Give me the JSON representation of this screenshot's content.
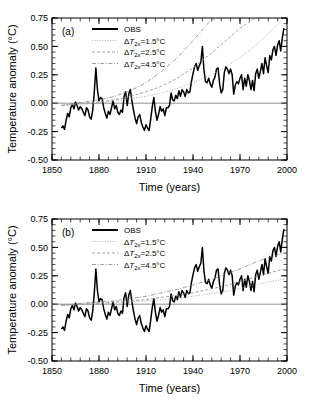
{
  "figure": {
    "panels": [
      {
        "label": "(a)",
        "axes": {
          "xlabel": "Time (years)",
          "ylabel": "Temperature anomaly (°C)",
          "xticks": [
            1850,
            1880,
            1910,
            1940,
            1970,
            2000
          ],
          "yticks": [
            "0.75",
            "0.50",
            "0.25",
            "0.00",
            "-0.25",
            "-0.50"
          ],
          "xlim": [
            1850,
            2000
          ],
          "ylim": [
            -0.5,
            0.75
          ],
          "xminor_step": 6,
          "yminor_step": 0.05,
          "grid": false,
          "zero_line": true
        },
        "legend": {
          "position": "top-left",
          "entries": [
            {
              "label": "OBS",
              "style": "solid-thick",
              "color": "#000000"
            },
            {
              "label": "ΔT2x=1.5°C",
              "style": "dotted",
              "color": "#9a9a9a"
            },
            {
              "label": "ΔT2x=2.5°C",
              "style": "dashed",
              "color": "#8a8a8a"
            },
            {
              "label": "ΔT2x=4.5°C",
              "style": "dashdot",
              "color": "#8a8a8a"
            }
          ]
        }
      },
      {
        "label": "(b)",
        "axes": {
          "xlabel": "Time (years)",
          "ylabel": "Temperature anomaly (°C)",
          "xticks": [
            1850,
            1880,
            1910,
            1940,
            1970,
            2000
          ],
          "yticks": [
            "0.75",
            "0.50",
            "0.25",
            "0.00",
            "-0.25",
            "-0.50"
          ],
          "xlim": [
            1850,
            2000
          ],
          "ylim": [
            -0.5,
            0.75
          ],
          "xminor_step": 6,
          "yminor_step": 0.05,
          "grid": false,
          "zero_line": true
        },
        "legend": {
          "position": "top-left",
          "entries": [
            {
              "label": "OBS",
              "style": "solid-thick",
              "color": "#000000"
            },
            {
              "label": "ΔT2x=1.5°C",
              "style": "dotted",
              "color": "#9a9a9a"
            },
            {
              "label": "ΔT2x=2.5°C",
              "style": "dashed",
              "color": "#8a8a8a"
            },
            {
              "label": "ΔT2x=4.5°C",
              "style": "dashdot",
              "color": "#8a8a8a"
            }
          ]
        }
      }
    ]
  },
  "chart_data": [
    {
      "type": "line",
      "panel": "(a)",
      "title": "",
      "xlabel": "Time (years)",
      "ylabel": "Temperature anomaly (°C)",
      "xlim": [
        1850,
        2000
      ],
      "ylim": [
        -0.5,
        0.75
      ],
      "grid": false,
      "legend_position": "top-left",
      "series": [
        {
          "name": "OBS",
          "style": "solid-thick",
          "color": "#000000",
          "x": [
            1856,
            1857,
            1858,
            1859,
            1860,
            1861,
            1862,
            1863,
            1864,
            1865,
            1866,
            1867,
            1868,
            1869,
            1870,
            1871,
            1872,
            1873,
            1874,
            1875,
            1876,
            1877,
            1878,
            1879,
            1880,
            1881,
            1882,
            1883,
            1884,
            1885,
            1886,
            1887,
            1888,
            1889,
            1890,
            1891,
            1892,
            1893,
            1894,
            1895,
            1896,
            1897,
            1898,
            1899,
            1900,
            1901,
            1902,
            1903,
            1904,
            1905,
            1906,
            1907,
            1908,
            1909,
            1910,
            1911,
            1912,
            1913,
            1914,
            1915,
            1916,
            1917,
            1918,
            1919,
            1920,
            1921,
            1922,
            1923,
            1924,
            1925,
            1926,
            1927,
            1928,
            1929,
            1930,
            1931,
            1932,
            1933,
            1934,
            1935,
            1936,
            1937,
            1938,
            1939,
            1940,
            1941,
            1942,
            1943,
            1944,
            1945,
            1946,
            1947,
            1948,
            1949,
            1950,
            1951,
            1952,
            1953,
            1954,
            1955,
            1956,
            1957,
            1958,
            1959,
            1960,
            1961,
            1962,
            1963,
            1964,
            1965,
            1966,
            1967,
            1968,
            1969,
            1970,
            1971,
            1972,
            1973,
            1974,
            1975,
            1976,
            1977,
            1978,
            1979,
            1980,
            1981,
            1982,
            1983,
            1984,
            1985,
            1986,
            1987,
            1988,
            1989,
            1990,
            1991,
            1992,
            1993,
            1994,
            1995,
            1996,
            1997,
            1998
          ],
          "y": [
            -0.22,
            -0.2,
            -0.23,
            -0.15,
            -0.09,
            -0.12,
            -0.04,
            -0.01,
            -0.05,
            0.01,
            -0.02,
            -0.06,
            -0.03,
            -0.05,
            -0.08,
            -0.11,
            -0.04,
            -0.06,
            -0.12,
            -0.14,
            -0.06,
            0.1,
            0.31,
            0.12,
            0.02,
            0.05,
            0.04,
            -0.04,
            -0.09,
            -0.13,
            -0.07,
            -0.1,
            -0.04,
            0.02,
            -0.05,
            -0.02,
            -0.08,
            -0.1,
            -0.06,
            -0.08,
            0.06,
            0.1,
            -0.02,
            0.08,
            0.12,
            0.02,
            -0.06,
            -0.13,
            -0.18,
            -0.12,
            -0.1,
            -0.17,
            -0.21,
            -0.24,
            -0.19,
            -0.22,
            -0.24,
            -0.14,
            -0.03,
            0.05,
            -0.07,
            -0.15,
            -0.1,
            -0.03,
            -0.07,
            -0.05,
            -0.11,
            -0.04,
            -0.04,
            -0.02,
            0.09,
            0.03,
            0.02,
            0.07,
            0.04,
            0.11,
            0.06,
            0.12,
            0.1,
            0.06,
            0.12,
            0.09,
            0.1,
            0.19,
            0.26,
            0.32,
            0.35,
            0.29,
            0.33,
            0.36,
            0.5,
            0.29,
            0.19,
            0.18,
            0.22,
            0.17,
            0.14,
            0.2,
            0.23,
            0.3,
            0.31,
            0.17,
            0.09,
            0.12,
            0.27,
            0.32,
            0.3,
            0.26,
            0.3,
            0.25,
            0.08,
            0.16,
            0.19,
            0.17,
            0.22,
            0.25,
            0.12,
            0.22,
            0.15,
            0.25,
            0.2,
            0.12,
            0.2,
            0.11,
            0.26,
            0.3,
            0.22,
            0.28,
            0.35,
            0.26,
            0.4,
            0.33,
            0.27,
            0.42,
            0.38,
            0.47,
            0.5,
            0.42,
            0.51,
            0.55,
            0.46,
            0.57,
            0.66,
            0.52,
            0.49,
            0.56
          ]
        },
        {
          "name": "ΔT2x=1.5°C",
          "style": "dotted",
          "color": "#9a9a9a",
          "x": [
            1856,
            1870,
            1880,
            1890,
            1900,
            1910,
            1920,
            1930,
            1940,
            1950,
            1960,
            1970,
            1980,
            1990,
            1998
          ],
          "y": [
            -0.02,
            -0.01,
            0.0,
            0.02,
            0.04,
            0.06,
            0.09,
            0.13,
            0.18,
            0.24,
            0.31,
            0.4,
            0.51,
            0.64,
            0.75
          ]
        },
        {
          "name": "ΔT2x=2.5°C",
          "style": "dashed",
          "color": "#8a8a8a",
          "x": [
            1856,
            1870,
            1880,
            1890,
            1900,
            1910,
            1920,
            1930,
            1940,
            1950,
            1960,
            1970,
            1980,
            1985
          ],
          "y": [
            -0.02,
            0.0,
            0.01,
            0.03,
            0.06,
            0.1,
            0.15,
            0.22,
            0.31,
            0.42,
            0.54,
            0.66,
            0.75,
            0.75
          ]
        },
        {
          "name": "ΔT2x=4.5°C",
          "style": "dashdot",
          "color": "#8a8a8a",
          "x": [
            1856,
            1870,
            1880,
            1890,
            1900,
            1910,
            1920,
            1930,
            1940,
            1950,
            1955
          ],
          "y": [
            -0.02,
            0.01,
            0.03,
            0.06,
            0.11,
            0.18,
            0.28,
            0.4,
            0.55,
            0.71,
            0.75
          ]
        }
      ]
    },
    {
      "type": "line",
      "panel": "(b)",
      "title": "",
      "xlabel": "Time (years)",
      "ylabel": "Temperature anomaly (°C)",
      "xlim": [
        1850,
        2000
      ],
      "ylim": [
        -0.5,
        0.75
      ],
      "grid": false,
      "legend_position": "top-left",
      "series": [
        {
          "name": "OBS",
          "style": "solid-thick",
          "color": "#000000",
          "x": [
            1856,
            1857,
            1858,
            1859,
            1860,
            1861,
            1862,
            1863,
            1864,
            1865,
            1866,
            1867,
            1868,
            1869,
            1870,
            1871,
            1872,
            1873,
            1874,
            1875,
            1876,
            1877,
            1878,
            1879,
            1880,
            1881,
            1882,
            1883,
            1884,
            1885,
            1886,
            1887,
            1888,
            1889,
            1890,
            1891,
            1892,
            1893,
            1894,
            1895,
            1896,
            1897,
            1898,
            1899,
            1900,
            1901,
            1902,
            1903,
            1904,
            1905,
            1906,
            1907,
            1908,
            1909,
            1910,
            1911,
            1912,
            1913,
            1914,
            1915,
            1916,
            1917,
            1918,
            1919,
            1920,
            1921,
            1922,
            1923,
            1924,
            1925,
            1926,
            1927,
            1928,
            1929,
            1930,
            1931,
            1932,
            1933,
            1934,
            1935,
            1936,
            1937,
            1938,
            1939,
            1940,
            1941,
            1942,
            1943,
            1944,
            1945,
            1946,
            1947,
            1948,
            1949,
            1950,
            1951,
            1952,
            1953,
            1954,
            1955,
            1956,
            1957,
            1958,
            1959,
            1960,
            1961,
            1962,
            1963,
            1964,
            1965,
            1966,
            1967,
            1968,
            1969,
            1970,
            1971,
            1972,
            1973,
            1974,
            1975,
            1976,
            1977,
            1978,
            1979,
            1980,
            1981,
            1982,
            1983,
            1984,
            1985,
            1986,
            1987,
            1988,
            1989,
            1990,
            1991,
            1992,
            1993,
            1994,
            1995,
            1996,
            1997,
            1998
          ],
          "y": [
            -0.22,
            -0.2,
            -0.23,
            -0.15,
            -0.09,
            -0.12,
            -0.04,
            -0.01,
            -0.05,
            0.01,
            -0.02,
            -0.06,
            -0.03,
            -0.05,
            -0.08,
            -0.11,
            -0.04,
            -0.06,
            -0.12,
            -0.14,
            -0.06,
            0.1,
            0.31,
            0.12,
            0.02,
            0.05,
            0.04,
            -0.04,
            -0.09,
            -0.13,
            -0.07,
            -0.1,
            -0.04,
            0.02,
            -0.05,
            -0.02,
            -0.08,
            -0.1,
            -0.06,
            -0.08,
            0.06,
            0.1,
            -0.02,
            0.08,
            0.12,
            0.02,
            -0.06,
            -0.13,
            -0.18,
            -0.12,
            -0.1,
            -0.17,
            -0.21,
            -0.24,
            -0.19,
            -0.22,
            -0.24,
            -0.14,
            -0.03,
            0.05,
            -0.07,
            -0.15,
            -0.1,
            -0.03,
            -0.07,
            -0.05,
            -0.11,
            -0.04,
            -0.04,
            -0.02,
            0.09,
            0.03,
            0.02,
            0.07,
            0.04,
            0.11,
            0.06,
            0.12,
            0.1,
            0.06,
            0.12,
            0.09,
            0.1,
            0.19,
            0.26,
            0.32,
            0.35,
            0.29,
            0.33,
            0.36,
            0.5,
            0.29,
            0.19,
            0.18,
            0.22,
            0.17,
            0.14,
            0.2,
            0.23,
            0.3,
            0.31,
            0.17,
            0.09,
            0.12,
            0.27,
            0.32,
            0.3,
            0.26,
            0.3,
            0.25,
            0.08,
            0.16,
            0.19,
            0.17,
            0.22,
            0.25,
            0.12,
            0.22,
            0.15,
            0.25,
            0.2,
            0.12,
            0.2,
            0.11,
            0.26,
            0.3,
            0.22,
            0.28,
            0.35,
            0.26,
            0.4,
            0.33,
            0.27,
            0.42,
            0.38,
            0.47,
            0.5,
            0.42,
            0.51,
            0.55,
            0.46,
            0.57,
            0.66,
            0.52,
            0.49,
            0.56
          ]
        },
        {
          "name": "ΔT2x=1.5°C",
          "style": "dotted",
          "color": "#9a9a9a",
          "x": [
            1856,
            1870,
            1880,
            1890,
            1900,
            1910,
            1920,
            1930,
            1940,
            1950,
            1960,
            1970,
            1980,
            1990,
            1998
          ],
          "y": [
            -0.01,
            0.0,
            0.0,
            0.01,
            0.02,
            0.03,
            0.04,
            0.05,
            0.07,
            0.09,
            0.11,
            0.14,
            0.17,
            0.2,
            0.22
          ]
        },
        {
          "name": "ΔT2x=2.5°C",
          "style": "dashed",
          "color": "#8a8a8a",
          "x": [
            1856,
            1870,
            1880,
            1890,
            1900,
            1910,
            1920,
            1930,
            1940,
            1950,
            1960,
            1970,
            1980,
            1990,
            1998
          ],
          "y": [
            -0.01,
            0.0,
            0.01,
            0.02,
            0.03,
            0.04,
            0.06,
            0.08,
            0.1,
            0.13,
            0.16,
            0.2,
            0.24,
            0.28,
            0.31
          ]
        },
        {
          "name": "ΔT2x=4.5°C",
          "style": "dashdot",
          "color": "#8a8a8a",
          "x": [
            1856,
            1870,
            1880,
            1890,
            1900,
            1910,
            1920,
            1930,
            1940,
            1950,
            1960,
            1970,
            1980,
            1990,
            1998
          ],
          "y": [
            -0.01,
            0.01,
            0.02,
            0.03,
            0.05,
            0.07,
            0.1,
            0.13,
            0.17,
            0.21,
            0.26,
            0.31,
            0.37,
            0.42,
            0.45
          ]
        }
      ]
    }
  ]
}
